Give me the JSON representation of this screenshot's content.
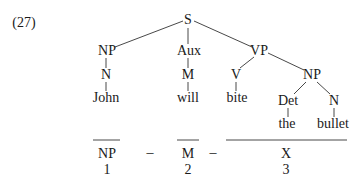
{
  "example_number": "(27)",
  "tree": {
    "root": "S",
    "np_subject": {
      "label": "NP",
      "child": "N",
      "word": "John"
    },
    "aux": {
      "label": "Aux",
      "child": "M",
      "word": "will"
    },
    "vp": {
      "label": "VP",
      "verb": {
        "label": "V",
        "word": "bite"
      },
      "np_object": {
        "label": "NP",
        "det": {
          "label": "Det",
          "word": "the"
        },
        "noun": {
          "label": "N",
          "word": "bullet"
        }
      }
    }
  },
  "analysis": {
    "terms": [
      {
        "label": "NP",
        "index": "1"
      },
      {
        "label": "M",
        "index": "2"
      },
      {
        "label": "X",
        "index": "3"
      }
    ],
    "separator": "–"
  }
}
